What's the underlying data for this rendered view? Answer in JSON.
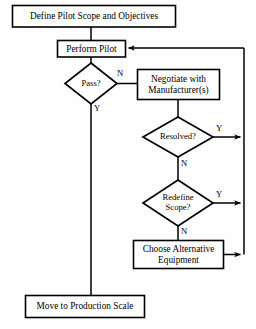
{
  "diagram": {
    "background_color": "#fefefe",
    "stroke_color": "#000000",
    "text_color": "#000000",
    "nodes": {
      "define_scope": {
        "shape": "process",
        "text": "Define Pilot Scope and Objectives"
      },
      "perform_pilot": {
        "shape": "process",
        "text": "Perform Pilot"
      },
      "pass": {
        "shape": "decision",
        "text": "Pass?"
      },
      "negotiate": {
        "shape": "process",
        "text": "Negotiate with\nManufacturer(s)"
      },
      "resolved": {
        "shape": "decision",
        "text": "Resolved?"
      },
      "redefine_scope": {
        "shape": "decision",
        "text": "Redefine\nScope?"
      },
      "choose_alternative": {
        "shape": "process",
        "text": "Choose Alternative\nEquipment"
      },
      "move_production": {
        "shape": "process",
        "text": "Move to Production Scale"
      }
    },
    "edge_labels": {
      "pass_no": "N",
      "pass_yes": "Y",
      "resolved_yes": "Y",
      "resolved_no": "N",
      "redefine_yes": "Y",
      "redefine_no": "N"
    }
  }
}
